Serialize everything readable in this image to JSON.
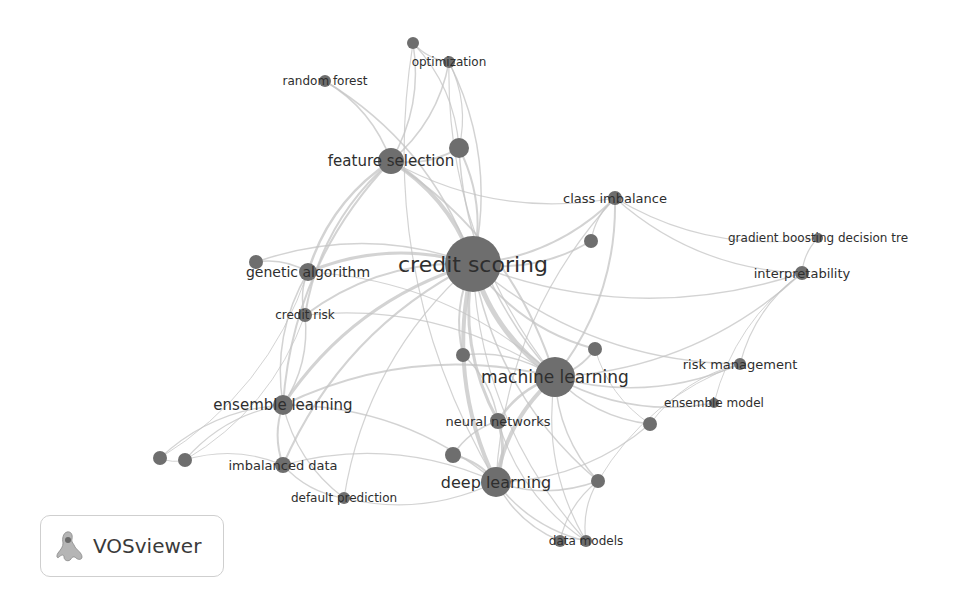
{
  "app": {
    "name": "VOSviewer",
    "logo_icon": "vosviewer-logo-icon"
  },
  "network": {
    "type": "keyword co-occurrence map",
    "colors": {
      "node": "#6e6e6e",
      "edge": "#c4c4c4",
      "label": "#2e2e2e"
    },
    "nodes": [
      {
        "id": "credit_scoring",
        "label": "credit scoring",
        "x": 473,
        "y": 264,
        "r": 28,
        "fs": 22
      },
      {
        "id": "machine_learning",
        "label": "machine learning",
        "x": 555,
        "y": 377,
        "r": 20,
        "fs": 17
      },
      {
        "id": "deep_learning",
        "label": "deep learning",
        "x": 496,
        "y": 482,
        "r": 15,
        "fs": 16
      },
      {
        "id": "feature_selection",
        "label": "feature selection",
        "x": 391,
        "y": 161,
        "r": 13,
        "fs": 15
      },
      {
        "id": "fs_neighbor",
        "label": "",
        "x": 459,
        "y": 148,
        "r": 10,
        "fs": 0
      },
      {
        "id": "genetic_algorithm",
        "label": "genetic algorithm",
        "x": 308,
        "y": 272,
        "r": 9,
        "fs": 14
      },
      {
        "id": "ga_neighbor",
        "label": "",
        "x": 256,
        "y": 262,
        "r": 7,
        "fs": 0
      },
      {
        "id": "ensemble_learning",
        "label": "ensemble learning",
        "x": 283,
        "y": 405,
        "r": 10,
        "fs": 15
      },
      {
        "id": "credit_risk",
        "label": "credit risk",
        "x": 305,
        "y": 315,
        "r": 7,
        "fs": 12
      },
      {
        "id": "random_forest",
        "label": "random forest",
        "x": 325,
        "y": 81,
        "r": 6,
        "fs": 12
      },
      {
        "id": "optimization",
        "label": "optimization",
        "x": 449,
        "y": 62,
        "r": 6,
        "fs": 12
      },
      {
        "id": "opt_neighbor",
        "label": "",
        "x": 413,
        "y": 43,
        "r": 6,
        "fs": 0
      },
      {
        "id": "class_imbalance",
        "label": "class imbalance",
        "x": 615,
        "y": 198,
        "r": 7,
        "fs": 13
      },
      {
        "id": "ci_neighbor",
        "label": "",
        "x": 591,
        "y": 241,
        "r": 7,
        "fs": 0
      },
      {
        "id": "gbdt",
        "label": "gradient boosting decision tre",
        "x": 818,
        "y": 238,
        "r": 5,
        "fs": 12
      },
      {
        "id": "interpretability",
        "label": "interpretability",
        "x": 802,
        "y": 273,
        "r": 7,
        "fs": 13
      },
      {
        "id": "risk_management",
        "label": "risk management",
        "x": 740,
        "y": 364,
        "r": 6,
        "fs": 13
      },
      {
        "id": "ensemble_model",
        "label": "ensemble model",
        "x": 714,
        "y": 403,
        "r": 5,
        "fs": 12
      },
      {
        "id": "neural_networks",
        "label": "neural networks",
        "x": 498,
        "y": 421,
        "r": 8,
        "fs": 13
      },
      {
        "id": "nn_neighbor",
        "label": "",
        "x": 463,
        "y": 355,
        "r": 7,
        "fs": 0
      },
      {
        "id": "ml_neighbor",
        "label": "",
        "x": 595,
        "y": 349,
        "r": 7,
        "fs": 0
      },
      {
        "id": "em_neighbor",
        "label": "",
        "x": 650,
        "y": 424,
        "r": 7,
        "fs": 0
      },
      {
        "id": "imbalanced_data",
        "label": "imbalanced data",
        "x": 283,
        "y": 465,
        "r": 8,
        "fs": 13
      },
      {
        "id": "left_a",
        "label": "",
        "x": 160,
        "y": 458,
        "r": 7,
        "fs": 0
      },
      {
        "id": "left_b",
        "label": "",
        "x": 185,
        "y": 460,
        "r": 7,
        "fs": 0
      },
      {
        "id": "default_prediction",
        "label": "default prediction",
        "x": 344,
        "y": 498,
        "r": 6,
        "fs": 12
      },
      {
        "id": "dl_neighbor",
        "label": "",
        "x": 453,
        "y": 455,
        "r": 8,
        "fs": 0
      },
      {
        "id": "dl_right",
        "label": "",
        "x": 598,
        "y": 481,
        "r": 7,
        "fs": 0
      },
      {
        "id": "data_models",
        "label": "data models",
        "x": 586,
        "y": 541,
        "r": 6,
        "fs": 12
      },
      {
        "id": "dm_neighbor",
        "label": "",
        "x": 560,
        "y": 541,
        "r": 6,
        "fs": 0
      }
    ],
    "edges": [
      [
        "credit_scoring",
        "machine_learning",
        5
      ],
      [
        "credit_scoring",
        "deep_learning",
        4
      ],
      [
        "credit_scoring",
        "feature_selection",
        4
      ],
      [
        "credit_scoring",
        "genetic_algorithm",
        3
      ],
      [
        "credit_scoring",
        "ensemble_learning",
        3
      ],
      [
        "credit_scoring",
        "credit_risk",
        2
      ],
      [
        "credit_scoring",
        "class_imbalance",
        2
      ],
      [
        "credit_scoring",
        "neural_networks",
        3
      ],
      [
        "credit_scoring",
        "fs_neighbor",
        2
      ],
      [
        "credit_scoring",
        "random_forest",
        1.5
      ],
      [
        "credit_scoring",
        "optimization",
        1.5
      ],
      [
        "credit_scoring",
        "ci_neighbor",
        2
      ],
      [
        "credit_scoring",
        "imbalanced_data",
        2
      ],
      [
        "credit_scoring",
        "interpretability",
        1.5
      ],
      [
        "credit_scoring",
        "risk_management",
        1.5
      ],
      [
        "credit_scoring",
        "ml_neighbor",
        2
      ],
      [
        "credit_scoring",
        "nn_neighbor",
        2
      ],
      [
        "credit_scoring",
        "dl_right",
        1.5
      ],
      [
        "credit_scoring",
        "ga_neighbor",
        1.5
      ],
      [
        "credit_scoring",
        "data_models",
        1.2
      ],
      [
        "credit_scoring",
        "default_prediction",
        1.2
      ],
      [
        "machine_learning",
        "deep_learning",
        4
      ],
      [
        "machine_learning",
        "neural_networks",
        2.5
      ],
      [
        "machine_learning",
        "ensemble_learning",
        2
      ],
      [
        "machine_learning",
        "feature_selection",
        2
      ],
      [
        "machine_learning",
        "class_imbalance",
        2
      ],
      [
        "machine_learning",
        "risk_management",
        1.5
      ],
      [
        "machine_learning",
        "ensemble_model",
        1.5
      ],
      [
        "machine_learning",
        "interpretability",
        1.5
      ],
      [
        "machine_learning",
        "em_neighbor",
        1.5
      ],
      [
        "machine_learning",
        "ml_neighbor",
        2
      ],
      [
        "machine_learning",
        "dl_right",
        1.5
      ],
      [
        "machine_learning",
        "data_models",
        1.2
      ],
      [
        "machine_learning",
        "genetic_algorithm",
        1.2
      ],
      [
        "machine_learning",
        "credit_risk",
        1.2
      ],
      [
        "machine_learning",
        "nn_neighbor",
        1.5
      ],
      [
        "deep_learning",
        "neural_networks",
        3
      ],
      [
        "deep_learning",
        "data_models",
        1.5
      ],
      [
        "deep_learning",
        "dm_neighbor",
        1.5
      ],
      [
        "deep_learning",
        "dl_right",
        1.5
      ],
      [
        "deep_learning",
        "dl_neighbor",
        2
      ],
      [
        "deep_learning",
        "ensemble_learning",
        1.5
      ],
      [
        "deep_learning",
        "imbalanced_data",
        1.2
      ],
      [
        "deep_learning",
        "em_neighbor",
        1.2
      ],
      [
        "feature_selection",
        "random_forest",
        1.5
      ],
      [
        "feature_selection",
        "optimization",
        1.5
      ],
      [
        "feature_selection",
        "opt_neighbor",
        1.5
      ],
      [
        "feature_selection",
        "genetic_algorithm",
        2.5
      ],
      [
        "feature_selection",
        "credit_risk",
        2
      ],
      [
        "feature_selection",
        "ensemble_learning",
        2
      ],
      [
        "feature_selection",
        "fs_neighbor",
        2
      ],
      [
        "feature_selection",
        "class_imbalance",
        1.2
      ],
      [
        "fs_neighbor",
        "optimization",
        1.2
      ],
      [
        "fs_neighbor",
        "opt_neighbor",
        1.2
      ],
      [
        "fs_neighbor",
        "machine_learning",
        1.5
      ],
      [
        "opt_neighbor",
        "optimization",
        1.2
      ],
      [
        "opt_neighbor",
        "deep_learning",
        1.2
      ],
      [
        "optimization",
        "machine_learning",
        1.2
      ],
      [
        "genetic_algorithm",
        "ga_neighbor",
        1.5
      ],
      [
        "genetic_algorithm",
        "credit_risk",
        1.5
      ],
      [
        "genetic_algorithm",
        "ensemble_learning",
        1.5
      ],
      [
        "ensemble_learning",
        "imbalanced_data",
        2
      ],
      [
        "ensemble_learning",
        "left_a",
        1.2
      ],
      [
        "ensemble_learning",
        "left_b",
        1.2
      ],
      [
        "ensemble_learning",
        "default_prediction",
        1.2
      ],
      [
        "ensemble_learning",
        "credit_risk",
        1.5
      ],
      [
        "imbalanced_data",
        "left_b",
        1.2
      ],
      [
        "imbalanced_data",
        "default_prediction",
        1.2
      ],
      [
        "left_a",
        "left_b",
        1
      ],
      [
        "left_a",
        "genetic_algorithm",
        1
      ],
      [
        "left_b",
        "credit_risk",
        1
      ],
      [
        "class_imbalance",
        "ci_neighbor",
        1.2
      ],
      [
        "class_imbalance",
        "gbdt",
        1.2
      ],
      [
        "class_imbalance",
        "interpretability",
        1.2
      ],
      [
        "class_imbalance",
        "deep_learning",
        1.2
      ],
      [
        "gbdt",
        "interpretability",
        1.2
      ],
      [
        "interpretability",
        "risk_management",
        1.2
      ],
      [
        "interpretability",
        "ensemble_model",
        1
      ],
      [
        "risk_management",
        "em_neighbor",
        1
      ],
      [
        "risk_management",
        "dl_right",
        1
      ],
      [
        "neural_networks",
        "nn_neighbor",
        1.5
      ],
      [
        "neural_networks",
        "dl_neighbor",
        1.5
      ],
      [
        "neural_networks",
        "data_models",
        1.2
      ],
      [
        "dl_right",
        "data_models",
        1.2
      ],
      [
        "dl_right",
        "dm_neighbor",
        1.2
      ],
      [
        "data_models",
        "dm_neighbor",
        1
      ],
      [
        "default_prediction",
        "deep_learning",
        1.2
      ],
      [
        "ml_neighbor",
        "em_neighbor",
        1
      ]
    ]
  }
}
